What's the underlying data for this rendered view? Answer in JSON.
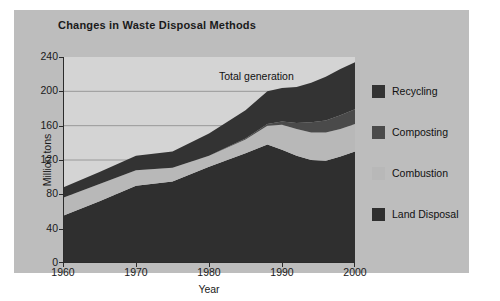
{
  "chart_data": {
    "type": "area",
    "title": "Changes in Waste Disposal Methods",
    "xlabel": "Year",
    "ylabel": "Million tons",
    "xlim": [
      1960,
      2000
    ],
    "ylim": [
      0,
      240
    ],
    "xticks": [
      "1960",
      "1970",
      "1980",
      "1990",
      "2000"
    ],
    "yticks": [
      "0",
      "40",
      "80",
      "120",
      "160",
      "200",
      "240"
    ],
    "grid": true,
    "grid_axis": "y",
    "stacked": true,
    "legend_position": "right",
    "annotations": [
      {
        "text": "Total generation",
        "x": 1985,
        "y": 218
      }
    ],
    "x": [
      1960,
      1965,
      1970,
      1975,
      1980,
      1985,
      1988,
      1990,
      1992,
      1994,
      1996,
      1998,
      2000
    ],
    "series": [
      {
        "name": "Land Disposal",
        "color": "#2f2f2f",
        "values": [
          55,
          72,
          90,
          95,
          112,
          128,
          138,
          132,
          125,
          120,
          119,
          124,
          130
        ]
      },
      {
        "name": "Combustion",
        "color": "#b8b8b8",
        "values": [
          21,
          20,
          18,
          16,
          13,
          16,
          22,
          29,
          31,
          32,
          33,
          32,
          32
        ]
      },
      {
        "name": "Composting",
        "color": "#4a4a4a",
        "values": [
          0,
          0,
          0,
          0,
          0,
          1,
          2,
          4,
          7,
          12,
          14,
          16,
          17
        ]
      },
      {
        "name": "Recycling",
        "color": "#333333",
        "values": [
          12,
          14,
          17,
          19,
          26,
          33,
          38,
          39,
          42,
          46,
          51,
          54,
          55
        ]
      }
    ],
    "totals": [
      88,
      106,
      125,
      130,
      151,
      178,
      200,
      204,
      205,
      210,
      217,
      226,
      234
    ]
  },
  "legend": {
    "items": [
      {
        "label": "Recycling",
        "color": "#333333"
      },
      {
        "label": "Composting",
        "color": "#4a4a4a"
      },
      {
        "label": "Combustion",
        "color": "#b8b8b8"
      },
      {
        "label": "Land Disposal",
        "color": "#2f2f2f"
      }
    ]
  },
  "colors": {
    "figure_background": "#ffffff",
    "panel_background": "#bdbdbd",
    "plot_background": "#d4d4d4",
    "axis": "#2b2b2b",
    "gridline": "#8a8a8a",
    "text": "#1a1a1a"
  }
}
